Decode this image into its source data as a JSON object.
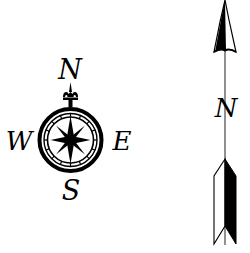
{
  "compass_rose": {
    "north_label": "N",
    "east_label": "E",
    "south_label": "S",
    "west_label": "W"
  },
  "north_arrow": {
    "label": "N"
  },
  "colors": {
    "ink": "#000000",
    "background": "#ffffff",
    "arrow_shaft": "#555555"
  }
}
